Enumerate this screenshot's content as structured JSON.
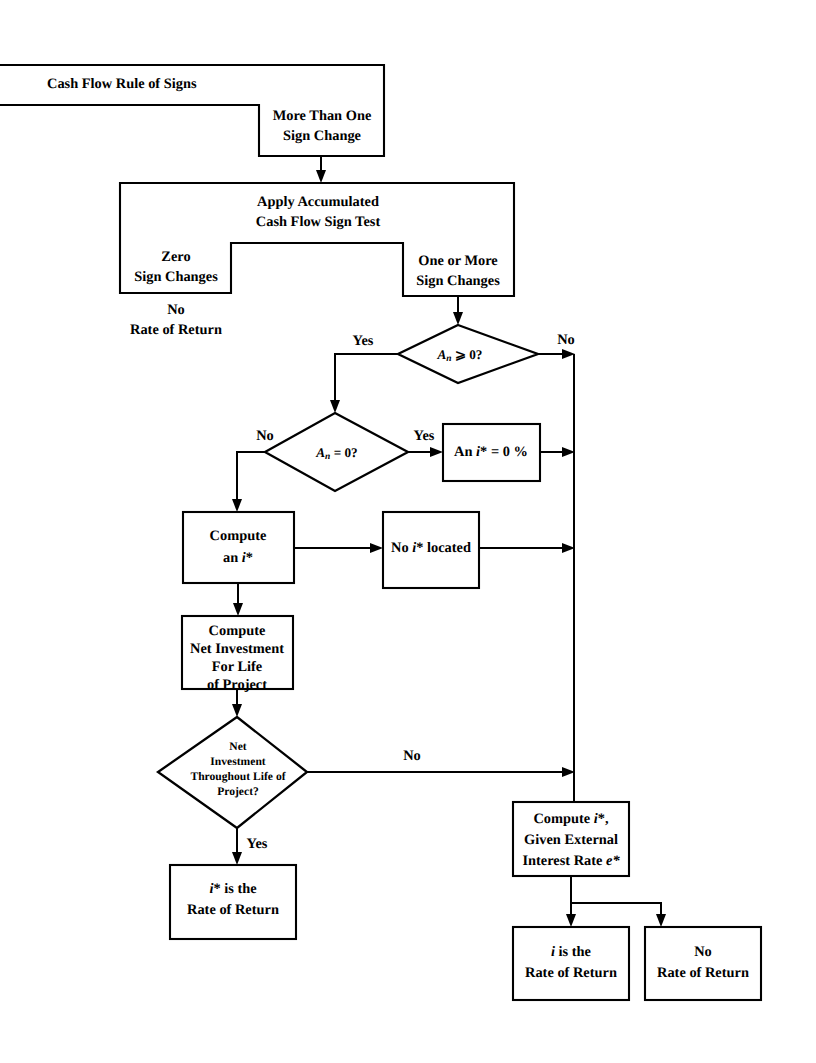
{
  "diagram": {
    "type": "flowchart",
    "nodes": {
      "rule_of_signs": "Cash Flow Rule of Signs",
      "more_than_one_l1": "More Than One",
      "more_than_one_l2": "Sign Change",
      "apply_test_l1": "Apply Accumulated",
      "apply_test_l2": "Cash Flow Sign Test",
      "zero_sign_l1": "Zero",
      "zero_sign_l2": "Sign Changes",
      "one_or_more_l1": "One or More",
      "one_or_more_l2": "Sign Changes",
      "no_rate_of_return_left_l1": "No",
      "no_rate_of_return_left_l2": "Rate of Return",
      "diamond_an_ge_0_pre": "A",
      "diamond_an_ge_0_sub": "n",
      "diamond_an_ge_0_post": " ⩾ 0?",
      "diamond_an_eq_0_pre": "A",
      "diamond_an_eq_0_sub": "n",
      "diamond_an_eq_0_post": " = 0?",
      "an_istar_zero_pre": "An ",
      "an_istar_zero_i": "i",
      "an_istar_zero_post": "* = 0 %",
      "compute_istar_l1": "Compute",
      "compute_istar_l2_pre": "an ",
      "compute_istar_l2_i": "i",
      "compute_istar_l2_post": "*",
      "no_istar_located_pre": "No ",
      "no_istar_located_i": "i",
      "no_istar_located_post": "* located",
      "compute_net_inv_l1": "Compute",
      "compute_net_inv_l2": "Net Investment",
      "compute_net_inv_l3": "For Life",
      "compute_net_inv_l4": "of Project",
      "net_inv_diamond_l1": "Net",
      "net_inv_diamond_l2": "Investment",
      "net_inv_diamond_l3": "Throughout Life of",
      "net_inv_diamond_l4": "Project?",
      "istar_is_ror_l1_i": "i",
      "istar_is_ror_l1_post": "* is the",
      "istar_is_ror_l2": "Rate of Return",
      "compute_istar_ext_l1_pre": "Compute ",
      "compute_istar_ext_l1_i": "i",
      "compute_istar_ext_l1_post": "*,",
      "compute_istar_ext_l2": "Given External",
      "compute_istar_ext_l3_pre": "Interest Rate ",
      "compute_istar_ext_l3_post": "e*",
      "i_is_ror_l1_i": "i",
      "i_is_ror_l1_post": "  is the",
      "i_is_ror_l2": "Rate of Return",
      "no_ror_right_l1": "No",
      "no_ror_right_l2": "Rate of Return"
    },
    "edge_labels": {
      "yes_to_an_eq_0": "Yes",
      "no_from_an_ge_0": "No",
      "no_to_compute_istar": "No",
      "yes_to_an_istar_zero": "Yes",
      "no_from_net_inv": "No",
      "yes_from_net_inv": "Yes"
    },
    "colors": {
      "stroke": "#000000",
      "fill": "#ffffff",
      "background": "#ffffff"
    }
  }
}
